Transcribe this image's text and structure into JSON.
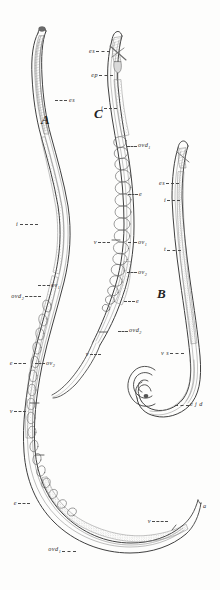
{
  "plate": {
    "title": "Comparative anatomy of nematode worms",
    "background_color": "#fdfdfc",
    "ink_color": "#3a3a3a",
    "width": 220,
    "height": 590
  },
  "figures": [
    {
      "key": "A",
      "label": "A",
      "caption": "Female nematode, whole body, lateral view"
    },
    {
      "key": "B",
      "label": "B",
      "caption": "Male nematode, whole body with curved tail"
    },
    {
      "key": "C",
      "label": "C",
      "caption": "Female nematode, anterior half enlarged"
    }
  ],
  "labels": {
    "figure_a": [
      {
        "id": "a-es",
        "text": "es",
        "sub": "",
        "align": "left"
      },
      {
        "id": "a-i",
        "text": "i",
        "sub": "",
        "align": "right"
      },
      {
        "id": "a-ov1",
        "text": "ov",
        "sub": "1",
        "align": "left"
      },
      {
        "id": "a-ovd2",
        "text": "ovd",
        "sub": "2",
        "align": "right"
      },
      {
        "id": "a-e1",
        "text": "e",
        "sub": "",
        "align": "right"
      },
      {
        "id": "a-ov2",
        "text": "ov",
        "sub": "2",
        "align": "left"
      },
      {
        "id": "a-v1",
        "text": "v",
        "sub": "",
        "align": "right"
      },
      {
        "id": "a-e2",
        "text": "e",
        "sub": "",
        "align": "right"
      },
      {
        "id": "a-ovd1",
        "text": "ovd",
        "sub": "1",
        "align": "right"
      },
      {
        "id": "a-v2",
        "text": "v",
        "sub": "",
        "align": "right"
      },
      {
        "id": "a-a",
        "text": "a",
        "sub": "",
        "align": "left"
      }
    ],
    "figure_b": [
      {
        "id": "b-es",
        "text": "es",
        "sub": "",
        "align": "right"
      },
      {
        "id": "b-i",
        "text": "i",
        "sub": "",
        "align": "right"
      },
      {
        "id": "b-t",
        "text": "t",
        "sub": "",
        "align": "right"
      },
      {
        "id": "b-vs",
        "text": "v s",
        "sub": "",
        "align": "right"
      },
      {
        "id": "b-ejd",
        "text": "e j d",
        "sub": "",
        "align": "left"
      }
    ],
    "figure_c": [
      {
        "id": "c-es",
        "text": "es",
        "sub": "",
        "align": "right"
      },
      {
        "id": "c-ep",
        "text": "ep",
        "sub": "",
        "align": "right"
      },
      {
        "id": "c-i",
        "text": "i",
        "sub": "",
        "align": "right"
      },
      {
        "id": "c-ovd1",
        "text": "ovd",
        "sub": "1",
        "align": "left"
      },
      {
        "id": "c-e1",
        "text": "e",
        "sub": "",
        "align": "left"
      },
      {
        "id": "c-v1",
        "text": "v",
        "sub": "",
        "align": "right"
      },
      {
        "id": "c-ov1",
        "text": "ov",
        "sub": "1",
        "align": "left"
      },
      {
        "id": "c-ov2",
        "text": "ov",
        "sub": "2",
        "align": "left"
      },
      {
        "id": "c-e2",
        "text": "e",
        "sub": "",
        "align": "left"
      },
      {
        "id": "c-ovd2",
        "text": "ovd",
        "sub": "2",
        "align": "left"
      },
      {
        "id": "c-v2",
        "text": "v",
        "sub": "",
        "align": "right"
      }
    ]
  },
  "legend_keys": {
    "es": "oesophagus",
    "ep": "excretory pore",
    "i": "intestine",
    "ov": "ovary",
    "ovd": "oviduct",
    "e": "egg",
    "v": "vulva",
    "a": "anus",
    "t": "testis",
    "vs": "vesicula seminalis",
    "ejd": "ejaculatory duct"
  }
}
